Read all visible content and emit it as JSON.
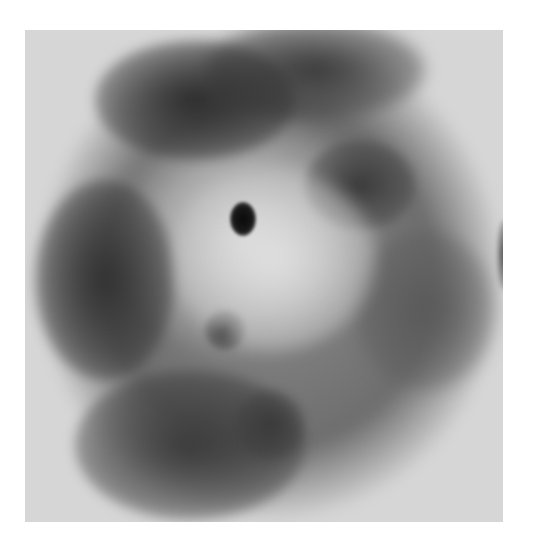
{
  "image": {
    "description": "Grayscale circular microscopy/radiograph-style specimen with dark mottled regions and a small dark central hole",
    "background_color": "#ffffff",
    "frame_color": "#d6d6d6",
    "colors": {
      "darkest": "#0a0a0a",
      "dark": "#333333",
      "mid": "#8a8a8a",
      "light": "#e6e6e6"
    }
  }
}
